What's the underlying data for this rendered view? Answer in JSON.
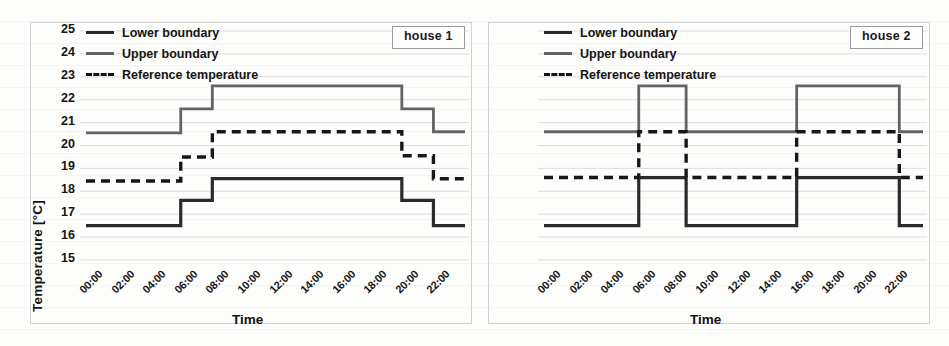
{
  "figure": {
    "panels": [
      {
        "id": "house-1",
        "badge": "house 1",
        "xlabel": "Time",
        "ylabel": "Temperature [°C]",
        "show_y_axis": true
      },
      {
        "id": "house-2",
        "badge": "house 2",
        "xlabel": "Time",
        "ylabel": "Temperature [°C]",
        "show_y_axis": false
      }
    ],
    "legend": {
      "items": [
        {
          "label": "Lower boundary",
          "style": "solid",
          "color": "#2b2b2b"
        },
        {
          "label": "Upper boundary",
          "style": "solid",
          "color": "#636363"
        },
        {
          "label": "Reference temperature",
          "style": "dashed",
          "color": "#171717"
        }
      ]
    }
  },
  "chart_data": [
    {
      "type": "line",
      "title": "house 1",
      "xlabel": "Time",
      "ylabel": "Temperature [°C]",
      "xlim": [
        0,
        24
      ],
      "ylim": [
        15,
        25
      ],
      "yticks": [
        15,
        16,
        17,
        18,
        19,
        20,
        21,
        22,
        23,
        24,
        25
      ],
      "xticks": [
        "00:00",
        "02:00",
        "04:00",
        "06:00",
        "08:00",
        "10:00",
        "12:00",
        "14:00",
        "16:00",
        "18:00",
        "20:00",
        "22:00"
      ],
      "xtick_hours": [
        0,
        2,
        4,
        6,
        8,
        10,
        12,
        14,
        16,
        18,
        20,
        22
      ],
      "grid": "faint-horizontal",
      "legend_position": "top-left",
      "series": [
        {
          "name": "Lower boundary",
          "style": "solid",
          "color": "#2b2b2b",
          "step": true,
          "x": [
            0,
            6,
            6,
            8,
            8,
            20,
            20,
            22,
            22,
            24
          ],
          "y": [
            16.5,
            16.5,
            17.6,
            17.6,
            18.55,
            18.55,
            17.6,
            17.6,
            16.5,
            16.5
          ]
        },
        {
          "name": "Upper boundary",
          "style": "solid",
          "color": "#636363",
          "step": true,
          "x": [
            0,
            6,
            6,
            8,
            8,
            20,
            20,
            22,
            22,
            24
          ],
          "y": [
            20.55,
            20.55,
            21.6,
            21.6,
            22.6,
            22.6,
            21.6,
            21.6,
            20.6,
            20.6
          ]
        },
        {
          "name": "Reference temperature",
          "style": "dashed",
          "color": "#171717",
          "step": true,
          "x": [
            0,
            6,
            6,
            8,
            8,
            20,
            20,
            22,
            22,
            24
          ],
          "y": [
            18.45,
            18.45,
            19.5,
            19.5,
            20.6,
            20.6,
            19.55,
            19.55,
            18.55,
            18.55
          ]
        }
      ]
    },
    {
      "type": "line",
      "title": "house 2",
      "xlabel": "Time",
      "ylabel": "Temperature [°C]",
      "xlim": [
        0,
        24
      ],
      "ylim": [
        15,
        25
      ],
      "yticks": [
        15,
        16,
        17,
        18,
        19,
        20,
        21,
        22,
        23,
        24,
        25
      ],
      "xticks": [
        "00:00",
        "02:00",
        "04:00",
        "06:00",
        "08:00",
        "10:00",
        "12:00",
        "14:00",
        "16:00",
        "18:00",
        "20:00",
        "22:00"
      ],
      "xtick_hours": [
        0,
        2,
        4,
        6,
        8,
        10,
        12,
        14,
        16,
        18,
        20,
        22
      ],
      "grid": "faint-horizontal",
      "legend_position": "top-left",
      "series": [
        {
          "name": "Lower boundary",
          "style": "solid",
          "color": "#2b2b2b",
          "step": true,
          "x": [
            0,
            6,
            6,
            9,
            9,
            16,
            16,
            22.5,
            22.5,
            24
          ],
          "y": [
            16.5,
            16.5,
            18.6,
            18.6,
            16.5,
            16.5,
            18.6,
            18.6,
            16.5,
            16.5
          ]
        },
        {
          "name": "Upper boundary",
          "style": "solid",
          "color": "#636363",
          "step": true,
          "x": [
            0,
            6,
            6,
            9,
            9,
            16,
            16,
            22.5,
            22.5,
            24
          ],
          "y": [
            20.6,
            20.6,
            22.6,
            22.6,
            20.6,
            20.6,
            22.6,
            22.6,
            20.6,
            20.6
          ]
        },
        {
          "name": "Reference temperature",
          "style": "dashed",
          "color": "#171717",
          "step": true,
          "x": [
            0,
            6,
            6,
            9,
            9,
            16,
            16,
            22.5,
            22.5,
            24
          ],
          "y": [
            18.6,
            18.6,
            20.6,
            20.6,
            18.6,
            18.6,
            20.6,
            20.6,
            18.6,
            18.6
          ]
        }
      ]
    }
  ]
}
